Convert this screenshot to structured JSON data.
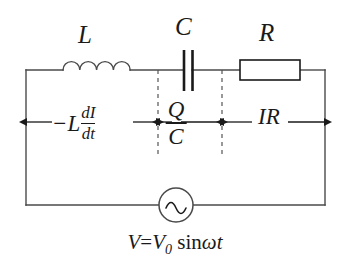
{
  "figure": {
    "type": "series-RLC-circuit-with-AC-source",
    "background_color": "#ffffff",
    "line_color": "#1a1a1a"
  },
  "components": {
    "inductor": {
      "label": "L",
      "symbol_name": "inductor-coil",
      "coil_count": 4
    },
    "capacitor": {
      "label": "C",
      "symbol_name": "capacitor-plates",
      "plate_count": 2
    },
    "resistor": {
      "label": "R",
      "symbol_name": "resistor-box"
    },
    "source": {
      "symbol_name": "ac-source-sine",
      "equation_v": "V",
      "equation_eq": "=",
      "equation_v0": "V",
      "equation_v0_sub": "0",
      "equation_sin": "sin",
      "equation_omega": "ω",
      "equation_t": "t",
      "equation_full": "V=V₀ sinωt"
    }
  },
  "voltage_labels": {
    "inductor_drop": {
      "lead": "−L",
      "numerator": "dI",
      "denominator": "dt",
      "full": "−L dI/dt"
    },
    "capacitor_drop": {
      "numerator": "Q",
      "denominator": "C",
      "full": "Q/C"
    },
    "resistor_drop": {
      "full": "IR"
    }
  },
  "annotations": {
    "dashed_divider_count": 2,
    "arrow_segments": 3
  }
}
